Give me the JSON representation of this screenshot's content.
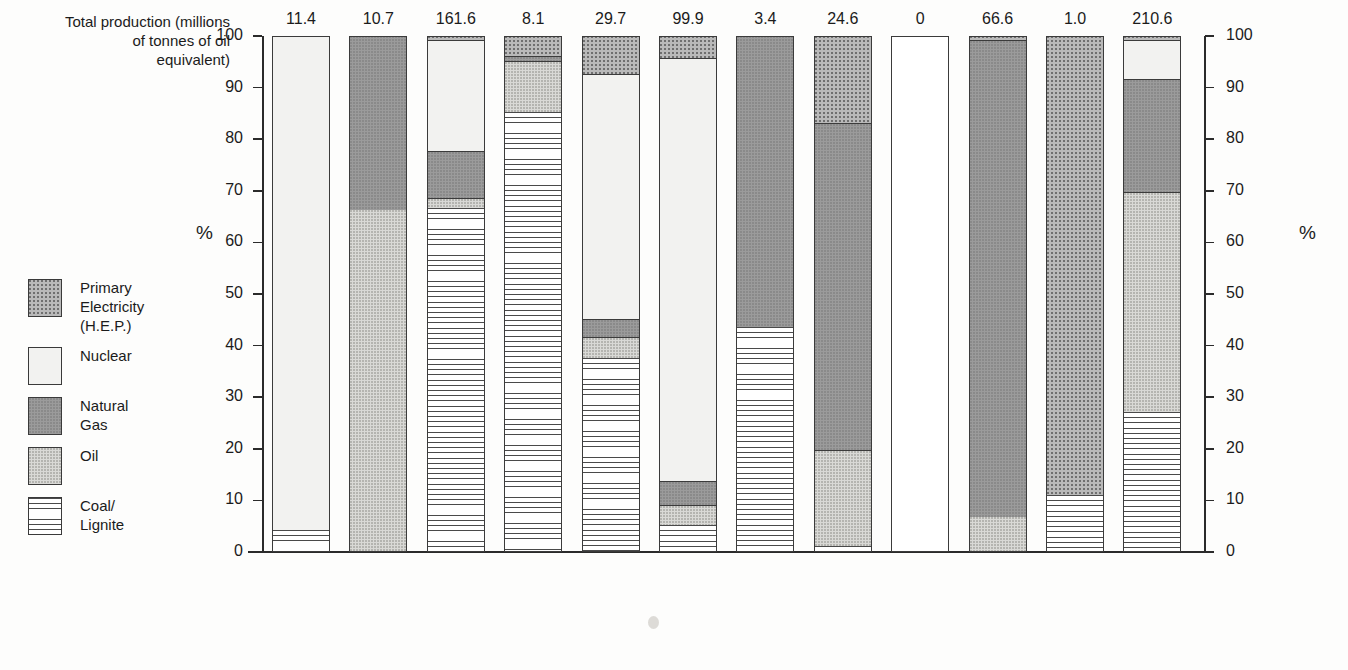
{
  "caption": "Total production\n(millions of tonnes\nof oil equivalent)",
  "axis": {
    "left_unit": "%",
    "right_unit": "%",
    "ticks": [
      0,
      10,
      20,
      30,
      40,
      50,
      60,
      70,
      80,
      90,
      100
    ]
  },
  "legend": {
    "items": [
      {
        "label": "Primary\nElectricity\n(H.E.P.)",
        "key": "hep",
        "swatch": "dotted-mid-gray"
      },
      {
        "label": "Nuclear",
        "key": "nuclear",
        "swatch": "plain-very-light"
      },
      {
        "label": "Natural\nGas",
        "key": "gas",
        "swatch": "solid-dark-gray"
      },
      {
        "label": "Oil",
        "key": "oil",
        "swatch": "fine-dotted-light"
      },
      {
        "label": "Coal/\nLignite",
        "key": "coal",
        "swatch": "horizontal-lines"
      }
    ]
  },
  "chart_data": {
    "type": "bar",
    "subtype": "stacked-100-percent",
    "title": "",
    "xlabel": "",
    "ylabel": "%",
    "ylim": [
      0,
      100
    ],
    "grid": false,
    "legend_position": "left",
    "series_order_bottom_to_top": [
      "Coal/Lignite",
      "Oil",
      "Natural Gas",
      "Nuclear",
      "Primary Electricity (H.E.P.)"
    ],
    "categories": [
      "Belgium",
      "Denmark",
      "Germany",
      "Greece",
      "Spain",
      "France",
      "Ireland",
      "Italy",
      "Luxembourg",
      "Netherlands",
      "Portugal",
      "U.K."
    ],
    "total_production_mtoe": [
      "11.4",
      "10.7",
      "161.6",
      "8.1",
      "29.7",
      "99.9",
      "3.4",
      "24.6",
      "0",
      "66.6",
      "1.0",
      "210.6"
    ],
    "series": [
      {
        "name": "Coal/Lignite",
        "values": [
          4.0,
          0.0,
          66.5,
          85.0,
          37.5,
          5.0,
          43.5,
          1.0,
          0,
          0.0,
          10.8,
          27.0
        ]
      },
      {
        "name": "Oil",
        "values": [
          0.0,
          66.0,
          2.0,
          10.0,
          4.0,
          4.0,
          0.0,
          18.5,
          0,
          6.5,
          0.0,
          42.5
        ]
      },
      {
        "name": "Natural Gas",
        "values": [
          0.0,
          34.0,
          9.0,
          1.0,
          3.5,
          4.5,
          56.5,
          63.5,
          0,
          92.5,
          0.0,
          22.0
        ]
      },
      {
        "name": "Nuclear",
        "values": [
          96.0,
          0.0,
          21.5,
          0.0,
          47.5,
          82.0,
          0.0,
          0.0,
          0,
          0.0,
          0.0,
          7.5
        ]
      },
      {
        "name": "Primary Electricity (H.E.P.)",
        "values": [
          0.0,
          0.0,
          1.0,
          4.0,
          7.5,
          4.5,
          0.0,
          17.0,
          0,
          1.0,
          89.2,
          1.0
        ]
      }
    ]
  }
}
